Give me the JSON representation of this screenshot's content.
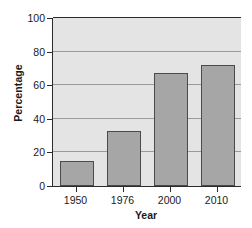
{
  "chart_data": {
    "type": "bar",
    "title": "",
    "categories": [
      "1950",
      "1976",
      "2000",
      "2010"
    ],
    "values": [
      15,
      33,
      67,
      72
    ],
    "series": [
      {
        "name": "Percentage",
        "values": [
          15,
          33,
          67,
          72
        ]
      }
    ],
    "xlabel": "Year",
    "ylabel": "Percentage",
    "ylim": [
      0,
      100
    ],
    "yticks": [
      0,
      20,
      40,
      60,
      80,
      100
    ],
    "ytick_labels": [
      "0",
      "20",
      "40",
      "60",
      "80",
      "100"
    ],
    "grid": true,
    "grid_axis": "y",
    "legend": false,
    "legend_position": "none"
  },
  "style": {
    "bar_fill": "#a6a6a6",
    "bar_edge": "#4a4a4a",
    "plot_background": "#e4e4e4",
    "gridline_color": "#9a9a9a",
    "axis_color": "#2b2b2b",
    "text_color": "#1a1a1a",
    "figure_background": "#ffffff"
  }
}
